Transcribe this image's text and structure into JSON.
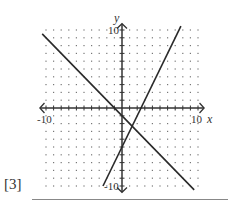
{
  "chart_data": {
    "type": "line",
    "title": "",
    "xlabel": "x",
    "ylabel": "y",
    "xlim": [
      -10,
      10
    ],
    "ylim": [
      -10,
      10
    ],
    "grid": "dotted",
    "tick_labels": {
      "x": [
        "-10",
        "10"
      ],
      "y": [
        "10",
        "-10"
      ]
    },
    "series": [
      {
        "name": "line-decreasing",
        "equation": "y = -x - 1",
        "slope": -1,
        "intercept": -1,
        "x": [
          -10.5,
          9.5
        ],
        "y": [
          9.5,
          -10.5
        ]
      },
      {
        "name": "line-increasing",
        "equation": "y = 2x - 5",
        "slope": 2,
        "intercept": -5,
        "x": [
          -2.5,
          7.75
        ],
        "y": [
          -10,
          10.5
        ]
      }
    ],
    "intersection": {
      "x": 1.33,
      "y": -2.33
    }
  },
  "labels": {
    "x_axis": "x",
    "y_axis": "y",
    "x_min": "-10",
    "x_max": "10",
    "y_max": "10",
    "y_min": "-10"
  },
  "question": {
    "marks": "[3]"
  },
  "colors": {
    "line": "#2a2a2a",
    "grid_dot": "#777777",
    "axis": "#333333"
  }
}
